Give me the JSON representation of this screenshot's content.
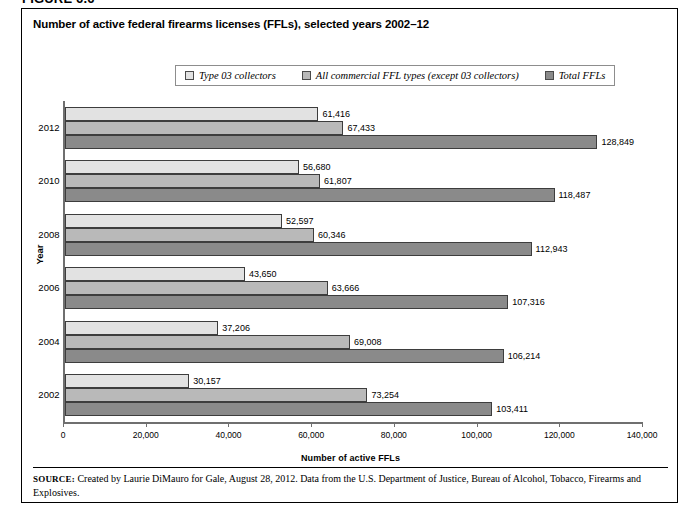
{
  "figure_number": "FIGURE 6.6",
  "title": "Number of active federal firearms licenses (FFLs), selected years 2002–12",
  "source": {
    "label": "SOURCE:",
    "text": " Created by Laurie DiMauro for Gale, August 28, 2012. Data from the U.S. Department of Justice, Bureau of Alcohol, Tobacco, Firearms and Explosives."
  },
  "colors": {
    "series1": "#e2e2e2",
    "series2": "#b9b9b9",
    "series3": "#8a8a8a",
    "axis": "#6f6f6f",
    "bar_border": "#3d3d3d"
  },
  "chart_data": {
    "type": "bar",
    "orientation": "horizontal",
    "title": "Number of active federal firearms licenses (FFLs), selected years 2002–12",
    "xlabel": "Number of active FFLs",
    "ylabel": "Year",
    "xlim": [
      0,
      140000
    ],
    "xticks": [
      0,
      20000,
      40000,
      60000,
      80000,
      100000,
      120000,
      140000
    ],
    "xtick_labels": [
      "0",
      "20,000",
      "40,000",
      "60,000",
      "80,000",
      "100,000",
      "120,000",
      "140,000"
    ],
    "categories": [
      "2012",
      "2010",
      "2008",
      "2006",
      "2004",
      "2002"
    ],
    "grid": false,
    "legend_position": "top-center",
    "series": [
      {
        "name": "Type 03 collectors",
        "color": "#e2e2e2",
        "values": [
          61416,
          56680,
          52597,
          43650,
          37206,
          30157
        ],
        "labels": [
          "61,416",
          "56,680",
          "52,597",
          "43,650",
          "37,206",
          "30,157"
        ]
      },
      {
        "name": "All commercial FFL types (except 03 collectors)",
        "color": "#b9b9b9",
        "values": [
          67433,
          61807,
          60346,
          63666,
          69008,
          73254
        ],
        "labels": [
          "67,433",
          "61,807",
          "60,346",
          "63,666",
          "69,008",
          "73,254"
        ]
      },
      {
        "name": "Total FFLs",
        "color": "#8a8a8a",
        "values": [
          128849,
          118487,
          112943,
          107316,
          106214,
          103411
        ],
        "labels": [
          "128,849",
          "118,487",
          "112,943",
          "107,316",
          "106,214",
          "103,411"
        ]
      }
    ]
  }
}
